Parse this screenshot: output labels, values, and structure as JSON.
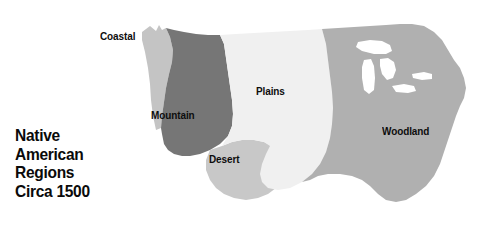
{
  "title": {
    "lines": [
      "Native",
      "American",
      "Regions",
      "Circa 1500"
    ],
    "full_text": "Native American Regions Circa 1500"
  },
  "map": {
    "subject": "Contiguous United States",
    "label_coastal": "Coastal",
    "label_mountain": "Mountain",
    "label_plains": "Plains",
    "label_desert": "Desert",
    "label_woodland": "Woodland"
  },
  "colors": {
    "background": "#ffffff",
    "text": "#0d0d0d",
    "coastal": "#c4c4c4",
    "mountain": "#767676",
    "plains": "#f0f0f0",
    "desert": "#c8c8c8",
    "woodland": "#b0b0b0",
    "lakes": "#ffffff"
  },
  "regions": [
    {
      "name": "Coastal",
      "label": "Coastal",
      "fill": "#c4c4c4"
    },
    {
      "name": "Mountain",
      "label": "Mountain",
      "fill": "#767676"
    },
    {
      "name": "Plains",
      "label": "Plains",
      "fill": "#f0f0f0"
    },
    {
      "name": "Desert",
      "label": "Desert",
      "fill": "#c8c8c8"
    },
    {
      "name": "Woodland",
      "label": "Woodland",
      "fill": "#b0b0b0"
    }
  ]
}
